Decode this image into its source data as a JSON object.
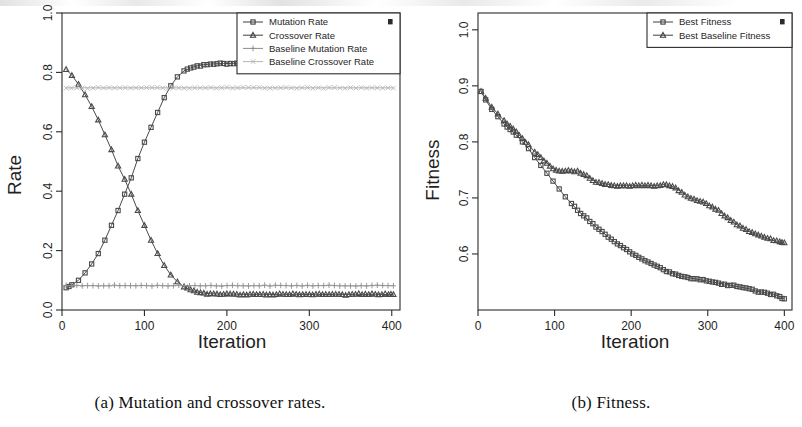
{
  "figure": {
    "subfigures": [
      {
        "id": "a",
        "caption": "(a) Mutation and crossover rates.",
        "chart_ref": 0
      },
      {
        "id": "b",
        "caption": "(b) Fitness.",
        "chart_ref": 1
      }
    ]
  },
  "chart_data": [
    {
      "type": "line",
      "title": "",
      "xlabel": "Iteration",
      "ylabel": "Rate",
      "xlim": [
        0,
        410
      ],
      "ylim": [
        0.0,
        1.0
      ],
      "xticks": [
        0,
        100,
        200,
        300,
        400
      ],
      "yticks": [
        "0.0",
        "0.2",
        "0.4",
        "0.6",
        "0.8",
        "1.0"
      ],
      "ytick_values": [
        0.0,
        0.2,
        0.4,
        0.6,
        0.8,
        1.0
      ],
      "grid": false,
      "legend_position": "top-right",
      "legend": [
        {
          "label": "Mutation Rate",
          "marker": "square",
          "color": "#4a4a4a"
        },
        {
          "label": "Crossover Rate",
          "marker": "triangle",
          "color": "#3a3a3a"
        },
        {
          "label": "Baseline Mutation Rate",
          "marker": "plus",
          "color": "#9a9a9a"
        },
        {
          "label": "Baseline Crossover Rate",
          "marker": "cross",
          "color": "#b0b0b0"
        }
      ],
      "series": [
        {
          "name": "Mutation Rate",
          "marker": "square",
          "x": [
            5,
            12,
            20,
            28,
            36,
            44,
            52,
            60,
            68,
            76,
            84,
            92,
            100,
            108,
            116,
            124,
            132,
            140,
            148,
            156,
            164,
            172,
            180,
            188,
            196,
            204,
            212,
            220,
            228,
            236,
            244,
            252,
            260,
            268,
            276,
            284,
            292,
            300,
            308,
            316,
            324,
            332,
            340,
            348,
            356,
            364,
            372,
            380,
            388,
            396,
            402
          ],
          "y": [
            0.075,
            0.085,
            0.1,
            0.125,
            0.155,
            0.19,
            0.235,
            0.285,
            0.335,
            0.39,
            0.445,
            0.51,
            0.565,
            0.615,
            0.665,
            0.715,
            0.755,
            0.785,
            0.805,
            0.815,
            0.822,
            0.826,
            0.828,
            0.829,
            0.83,
            0.83,
            0.831,
            0.831,
            0.83,
            0.831,
            0.832,
            0.831,
            0.83,
            0.832,
            0.831,
            0.83,
            0.831,
            0.832,
            0.831,
            0.83,
            0.832,
            0.831,
            0.83,
            0.831,
            0.832,
            0.831,
            0.83,
            0.831,
            0.83,
            0.831,
            0.83
          ]
        },
        {
          "name": "Crossover Rate",
          "marker": "triangle",
          "x": [
            5,
            12,
            20,
            28,
            36,
            44,
            52,
            60,
            68,
            76,
            84,
            92,
            100,
            108,
            116,
            124,
            132,
            140,
            148,
            156,
            164,
            172,
            180,
            188,
            196,
            204,
            212,
            220,
            228,
            236,
            244,
            252,
            260,
            268,
            276,
            284,
            292,
            300,
            308,
            316,
            324,
            332,
            340,
            348,
            356,
            364,
            372,
            380,
            388,
            396,
            402
          ],
          "y": [
            0.81,
            0.79,
            0.76,
            0.725,
            0.685,
            0.64,
            0.59,
            0.54,
            0.485,
            0.44,
            0.39,
            0.335,
            0.285,
            0.235,
            0.19,
            0.15,
            0.118,
            0.095,
            0.078,
            0.068,
            0.06,
            0.057,
            0.055,
            0.054,
            0.053,
            0.054,
            0.053,
            0.052,
            0.053,
            0.052,
            0.053,
            0.052,
            0.052,
            0.053,
            0.052,
            0.053,
            0.052,
            0.052,
            0.053,
            0.052,
            0.052,
            0.053,
            0.052,
            0.052,
            0.053,
            0.052,
            0.052,
            0.053,
            0.052,
            0.052,
            0.052
          ]
        },
        {
          "name": "Baseline Mutation Rate",
          "marker": "plus",
          "constant": 0.082,
          "x": [
            5,
            402
          ],
          "y": [
            0.082,
            0.082
          ]
        },
        {
          "name": "Baseline Crossover Rate",
          "marker": "cross",
          "constant": 0.748,
          "x": [
            5,
            402
          ],
          "y": [
            0.748,
            0.748
          ]
        }
      ]
    },
    {
      "type": "line",
      "title": "",
      "xlabel": "Iteration",
      "ylabel": "Fitness",
      "xlim": [
        0,
        410
      ],
      "ylim": [
        0.5,
        1.03
      ],
      "xticks": [
        0,
        100,
        200,
        300,
        400
      ],
      "yticks": [
        "0.6",
        "0.7",
        "0.8",
        "0.9",
        "1.0"
      ],
      "ytick_values": [
        0.6,
        0.7,
        0.8,
        0.9,
        1.0
      ],
      "grid": false,
      "legend_position": "top-right",
      "legend": [
        {
          "label": "Best Fitness",
          "marker": "square",
          "color": "#4a4a4a"
        },
        {
          "label": "Best Baseline Fitness",
          "marker": "triangle",
          "color": "#3a3a3a"
        }
      ],
      "series": [
        {
          "name": "Best Fitness",
          "marker": "square",
          "x": [
            4,
            10,
            18,
            26,
            34,
            42,
            50,
            58,
            66,
            74,
            82,
            90,
            98,
            106,
            114,
            122,
            130,
            138,
            146,
            154,
            162,
            170,
            178,
            186,
            194,
            202,
            210,
            218,
            226,
            234,
            242,
            250,
            258,
            266,
            274,
            282,
            290,
            298,
            306,
            314,
            322,
            330,
            338,
            346,
            354,
            362,
            370,
            378,
            386,
            394,
            400
          ],
          "y": [
            0.89,
            0.875,
            0.858,
            0.845,
            0.832,
            0.822,
            0.812,
            0.8,
            0.788,
            0.772,
            0.758,
            0.744,
            0.73,
            0.716,
            0.702,
            0.69,
            0.678,
            0.668,
            0.658,
            0.648,
            0.64,
            0.63,
            0.622,
            0.615,
            0.608,
            0.6,
            0.594,
            0.588,
            0.583,
            0.578,
            0.572,
            0.568,
            0.564,
            0.56,
            0.558,
            0.556,
            0.554,
            0.552,
            0.55,
            0.548,
            0.546,
            0.544,
            0.542,
            0.54,
            0.538,
            0.534,
            0.532,
            0.53,
            0.528,
            0.524,
            0.52
          ]
        },
        {
          "name": "Best Baseline Fitness",
          "marker": "triangle",
          "x": [
            4,
            10,
            18,
            26,
            34,
            42,
            50,
            58,
            66,
            74,
            82,
            90,
            98,
            106,
            114,
            122,
            130,
            138,
            146,
            154,
            162,
            170,
            178,
            186,
            194,
            202,
            210,
            218,
            226,
            234,
            242,
            250,
            258,
            266,
            274,
            282,
            290,
            298,
            306,
            314,
            322,
            330,
            338,
            346,
            354,
            362,
            370,
            378,
            386,
            394,
            400
          ],
          "y": [
            0.89,
            0.878,
            0.862,
            0.85,
            0.838,
            0.828,
            0.818,
            0.806,
            0.795,
            0.782,
            0.772,
            0.762,
            0.752,
            0.748,
            0.748,
            0.748,
            0.748,
            0.742,
            0.735,
            0.728,
            0.726,
            0.724,
            0.722,
            0.722,
            0.722,
            0.722,
            0.722,
            0.722,
            0.722,
            0.722,
            0.724,
            0.722,
            0.718,
            0.71,
            0.702,
            0.698,
            0.694,
            0.69,
            0.684,
            0.678,
            0.668,
            0.66,
            0.652,
            0.646,
            0.64,
            0.636,
            0.632,
            0.628,
            0.624,
            0.622,
            0.62
          ]
        }
      ]
    }
  ]
}
